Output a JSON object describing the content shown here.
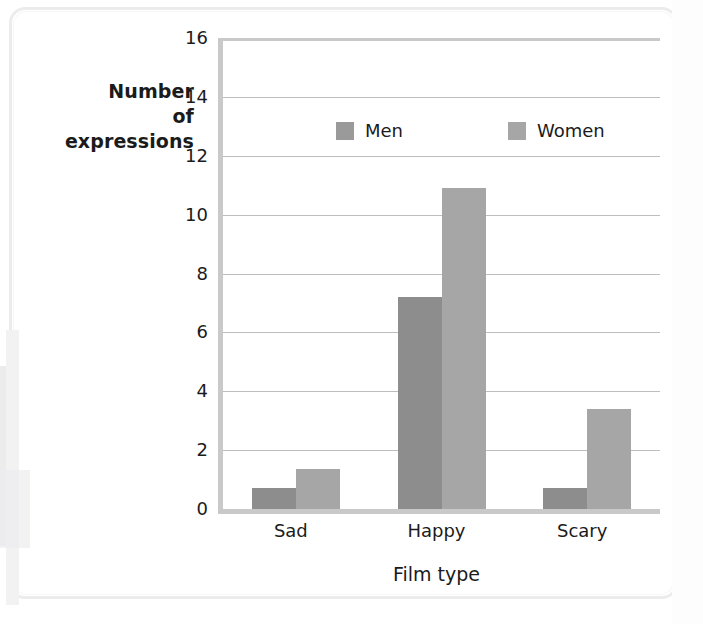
{
  "chart_data": {
    "type": "bar",
    "title": "",
    "xlabel": "Film type",
    "ylabel": "Number of expressions",
    "ylabel_lines": [
      "Number",
      "of",
      "expressions"
    ],
    "categories": [
      "Sad",
      "Happy",
      "Scary"
    ],
    "series": [
      {
        "name": "Men",
        "color": "#8d8d8e",
        "values": [
          0.7,
          7.2,
          0.7
        ]
      },
      {
        "name": "Women",
        "color": "#a6a6a7",
        "values": [
          1.35,
          10.9,
          3.4
        ]
      }
    ],
    "ylim": [
      0,
      16
    ],
    "ytick_step": 2,
    "ytick_labels": [
      "16",
      "14",
      "12",
      "10",
      "8",
      "6",
      "4",
      "2",
      "0"
    ],
    "ytick_values": [
      16,
      14,
      12,
      10,
      8,
      6,
      4,
      2,
      0
    ],
    "grid": true,
    "legend_position": "inside-top-center",
    "axis_color": "#c9c9ca",
    "gridline_color": "#bdbdbe",
    "text_color": "#1b1b1b"
  },
  "legend": {
    "entries": [
      {
        "label": "Men"
      },
      {
        "label": "Women"
      }
    ]
  },
  "axes": {
    "x_title": "Film type",
    "y_title_line1": "Number",
    "y_title_line2": "of",
    "y_title_line3": "expressions"
  }
}
